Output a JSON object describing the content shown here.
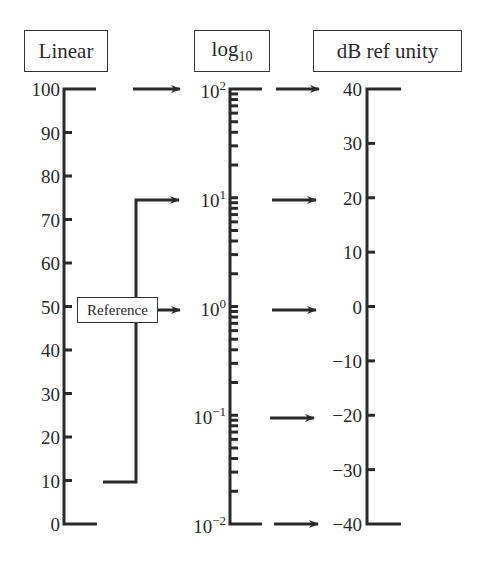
{
  "headers": {
    "linear": "Linear",
    "log_base": "log",
    "log_sub": "10",
    "db": "dB ref unity"
  },
  "reference_label": "Reference",
  "colors": {
    "ink": "#2a2a2a"
  },
  "linear_scale": {
    "ticks": [
      "100",
      "90",
      "80",
      "70",
      "60",
      "50",
      "40",
      "30",
      "20",
      "10",
      "0"
    ]
  },
  "log_scale": {
    "ticks": [
      {
        "base": "10",
        "exp": "2"
      },
      {
        "base": "10",
        "exp": "1"
      },
      {
        "base": "10",
        "exp": "0"
      },
      {
        "base": "10",
        "exp": "−1"
      },
      {
        "base": "10",
        "exp": "−2"
      }
    ]
  },
  "db_scale": {
    "ticks": [
      "40",
      "30",
      "20",
      "10",
      "0",
      "−10",
      "−20",
      "−30",
      "−40"
    ]
  },
  "chart_data": {
    "type": "diagram",
    "columns": [
      "Linear",
      "log10",
      "dB ref unity"
    ],
    "linear_range": [
      0,
      100
    ],
    "log_range": [
      "10^-2",
      "10^2"
    ],
    "db_range": [
      -40,
      40
    ],
    "mappings": [
      {
        "log": "10^2",
        "db": 40
      },
      {
        "log": "10^1",
        "db": 20
      },
      {
        "log": "10^0",
        "db": 0
      },
      {
        "log": "10^-1",
        "db": -20
      },
      {
        "log": "10^-2",
        "db": -40
      }
    ],
    "reference_bracket": {
      "linear_from": 10,
      "linear_to": 75,
      "maps_to_log": "10^1"
    },
    "reference_arrow": {
      "linear": 50,
      "maps_to_log": "10^0"
    },
    "top_arrow": {
      "linear": 100,
      "maps_to_log": "10^2"
    }
  }
}
